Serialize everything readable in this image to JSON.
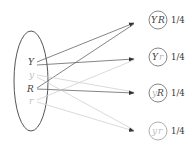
{
  "colors": {
    "dark": "#555555",
    "light": "#c8c8c8",
    "dark_text": "#444444",
    "light_text": "#b8b8b8"
  },
  "parent_gametes": [
    {
      "label": "Y",
      "dominant": true
    },
    {
      "label": "y",
      "dominant": false
    },
    {
      "label": "R",
      "dominant": true
    },
    {
      "label": "r",
      "dominant": false
    }
  ],
  "offspring": [
    {
      "allele1": "Y",
      "allele2": "R",
      "probability": "1/4"
    },
    {
      "allele1": "Y",
      "allele2": "r",
      "probability": "1/4"
    },
    {
      "allele1": "y",
      "allele2": "R",
      "probability": "1/4"
    },
    {
      "allele1": "y",
      "allele2": "r",
      "probability": "1/4"
    }
  ]
}
